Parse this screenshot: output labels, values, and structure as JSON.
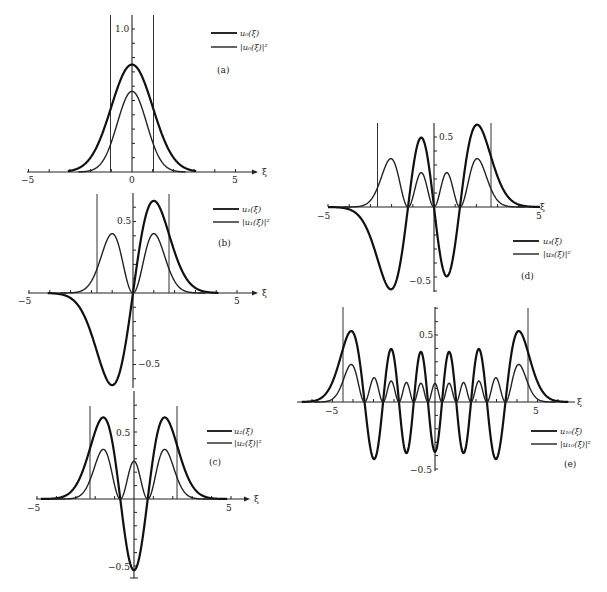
{
  "figure": {
    "x_variable": "ξ"
  },
  "chart_data": [
    {
      "panel": "(a)",
      "type": "line",
      "n": 0,
      "xlabel": "ξ",
      "x_ticks": [
        "-5",
        "0",
        "5"
      ],
      "y_ticks": [
        "1.0"
      ],
      "xlim": [
        -5,
        6
      ],
      "ylim": [
        0,
        1.1
      ],
      "turning_points": [
        -1,
        1
      ],
      "series": [
        {
          "name": "u0(ξ)",
          "style": "thick",
          "peak": 0.751
        },
        {
          "name": "|u0(ξ)|²",
          "style": "thin",
          "peak": 0.564
        }
      ],
      "legend": [
        "u0(ξ)",
        "|u0(ξ)|²"
      ]
    },
    {
      "panel": "(b)",
      "type": "line",
      "n": 1,
      "xlabel": "ξ",
      "x_ticks": [
        "-5",
        "5"
      ],
      "y_ticks": [
        "0.5",
        "-0.5"
      ],
      "xlim": [
        -5,
        6
      ],
      "ylim": [
        -0.7,
        0.7
      ],
      "turning_points": [
        -1.732,
        1.732
      ],
      "series": [
        {
          "name": "u1(ξ)",
          "style": "thick",
          "extrema": [
            [
              -1,
              -0.643
            ],
            [
              1,
              0.643
            ]
          ]
        },
        {
          "name": "|u1(ξ)|²",
          "style": "thin",
          "peaks": [
            [
              -1,
              0.414
            ],
            [
              1,
              0.414
            ]
          ]
        }
      ],
      "legend": [
        "u1(ξ)",
        "|u1(ξ)|²"
      ]
    },
    {
      "panel": "(c)",
      "type": "line",
      "n": 2,
      "xlabel": "ξ",
      "x_ticks": [
        "-5",
        "5"
      ],
      "y_ticks": [
        "0.5",
        "-0.5"
      ],
      "xlim": [
        -5,
        6
      ],
      "ylim": [
        -0.6,
        0.7
      ],
      "turning_points": [
        -2.236,
        2.236
      ],
      "series": [
        {
          "name": "u2(ξ)",
          "style": "thick",
          "extrema": [
            [
              -1.5,
              0.61
            ],
            [
              0,
              -0.531
            ],
            [
              1.5,
              0.61
            ]
          ]
        },
        {
          "name": "|u2(ξ)|²",
          "style": "thin",
          "peaks": [
            [
              -1.5,
              0.37
            ],
            [
              0,
              0.282
            ],
            [
              1.5,
              0.37
            ]
          ]
        }
      ],
      "legend": [
        "u2(ξ)",
        "|u2(ξ)|²"
      ]
    },
    {
      "panel": "(d)",
      "type": "line",
      "n": 3,
      "xlabel": "ξ",
      "x_ticks": [
        "-5",
        "5"
      ],
      "y_ticks": [
        "0.5",
        "-0.5"
      ],
      "xlim": [
        -5,
        5
      ],
      "ylim": [
        -0.65,
        0.65
      ],
      "turning_points": [
        -2.646,
        2.646
      ],
      "series": [
        {
          "name": "u3(ξ)",
          "style": "thick",
          "extrema": [
            [
              -1.9,
              -0.57
            ],
            [
              -0.6,
              0.51
            ],
            [
              0.6,
              -0.51
            ],
            [
              1.9,
              0.57
            ]
          ]
        },
        {
          "name": "|u3(ξ)|²",
          "style": "thin",
          "peaks": [
            [
              -1.9,
              0.33
            ],
            [
              -0.6,
              0.26
            ],
            [
              0.6,
              0.26
            ],
            [
              1.9,
              0.33
            ]
          ]
        }
      ],
      "legend": [
        "u3(ξ)",
        "|u3(ξ)|²"
      ]
    },
    {
      "panel": "(e)",
      "type": "line",
      "n": 10,
      "xlabel": "ξ",
      "x_ticks": [
        "-5",
        "5"
      ],
      "y_ticks": [
        "0.5",
        "-0.5"
      ],
      "xlim": [
        -6.5,
        6.5
      ],
      "ylim": [
        -0.6,
        0.75
      ],
      "turning_points": [
        -4.583,
        4.583
      ],
      "series": [
        {
          "name": "u10(ξ)",
          "style": "thick",
          "outer_peak": 0.53,
          "center_value": -0.3
        },
        {
          "name": "|u10(ξ)|²",
          "style": "thin",
          "outer_peak": 0.28
        }
      ],
      "legend": [
        "u10(ξ)",
        "|u10(ξ)|²"
      ]
    }
  ],
  "panels": {
    "a": {
      "id": "(a)",
      "legend1": "u₀(ξ)",
      "legend2": "|u₀(ξ)|²",
      "xmin": "−5",
      "x0": "0",
      "xmax": "5",
      "ytick": "1.0",
      "xvar": "ξ"
    },
    "b": {
      "id": "(b)",
      "legend1": "u₁(ξ)",
      "legend2": "|u₁(ξ)|²",
      "xmin": "−5",
      "xmax": "5",
      "ypos": "0.5",
      "yneg": "−0.5",
      "xvar": "ξ"
    },
    "c": {
      "id": "(c)",
      "legend1": "u₂(ξ)",
      "legend2": "|u₂(ξ)|²",
      "xmin": "−5",
      "xmax": "5",
      "ypos": "0.5",
      "yneg": "−0.5",
      "xvar": "ξ"
    },
    "d": {
      "id": "(d)",
      "legend1": "u₃(ξ)",
      "legend2": "|u₃(ξ)|²",
      "xmin": "−5",
      "xmax": "5",
      "ypos": "0.5",
      "yneg": "−0.5",
      "xvar": "ξ"
    },
    "e": {
      "id": "(e)",
      "legend1": "u₁₀(ξ)",
      "legend2": "|u₁₀(ξ)|²",
      "xmin": "−5",
      "xmax": "5",
      "ypos": "0.5",
      "yneg": "−0.5",
      "xvar": "ξ"
    }
  }
}
